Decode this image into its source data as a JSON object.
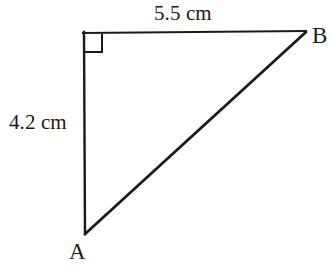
{
  "figure": {
    "type": "right-triangle-diagram",
    "background_color": "#ffffff",
    "stroke_color": "#1a1a1a",
    "text_color": "#1a1a1a",
    "width": 331,
    "height": 274,
    "vertices": [
      {
        "name": "A",
        "label": "A",
        "x": 85,
        "y": 233,
        "role": "bottom-left"
      },
      {
        "name": "B",
        "label": "B",
        "x": 305,
        "y": 31,
        "role": "top-right"
      },
      {
        "name": "C",
        "label": "",
        "x": 84,
        "y": 33,
        "role": "top-left-right-angle"
      }
    ],
    "edges": [
      {
        "name": "top-edge",
        "from": "C",
        "to": "B",
        "length_label": "5.5 cm",
        "stroke_width": 2
      },
      {
        "name": "left-edge",
        "from": "C",
        "to": "A",
        "length_label": "4.2 cm",
        "stroke_width": 2
      },
      {
        "name": "hypotenuse",
        "from": "A",
        "to": "B",
        "length_label": "",
        "stroke_width": 3
      }
    ],
    "right_angle_marker": {
      "at_vertex": "C",
      "size": 19,
      "x": 84,
      "y": 33,
      "stroke_width": 2
    }
  },
  "labels": {
    "top_side": {
      "value": "5.5",
      "unit": "cm",
      "text": "5.5 cm"
    },
    "left_side": {
      "value": "4.2",
      "unit": "cm",
      "text": "4.2 cm"
    },
    "vertex_a": "A",
    "vertex_b": "B"
  }
}
